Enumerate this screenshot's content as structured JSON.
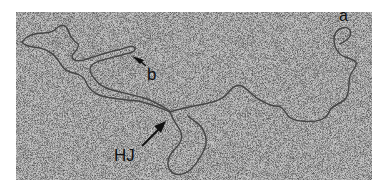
{
  "figure": {
    "type": "electron-micrograph",
    "labels": {
      "a": "a",
      "b": "b",
      "hj": "HJ"
    },
    "colors": {
      "background": "#ffffff",
      "field": "#b8b8b8",
      "strand": "#4a4a4a",
      "text": "#111111",
      "arrow": "#111111"
    }
  }
}
